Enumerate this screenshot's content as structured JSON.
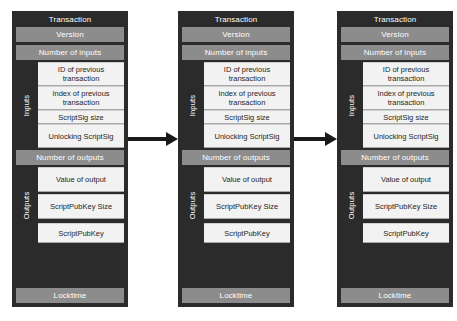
{
  "diagram": {
    "colors": {
      "block_background": "#2b2b2b",
      "bar_gray": "#8c8c8c",
      "field_light": "#f2f2f2",
      "arrow": "#1a1a1a",
      "page_background": "#ffffff",
      "text_light": "#ffffff",
      "text_dark": "#262626"
    },
    "arrows": [
      {
        "name": "arrow-block1-to-block2",
        "direction": "right"
      },
      {
        "name": "arrow-block2-to-block3",
        "direction": "right"
      }
    ],
    "blocks": [
      {
        "title": "Transaction",
        "version_label": "Version",
        "num_inputs_label": "Number of inputs",
        "inputs_side_label": "Inputs",
        "input_fields": [
          "ID of previous transaction",
          "Index of previous transaction",
          "ScriptSig size",
          "Unlocking ScriptSig"
        ],
        "num_outputs_label": "Number of outputs",
        "outputs_side_label": "Outputs",
        "output_fields": [
          "Value of output",
          "ScriptPubKey Size",
          "ScriptPubKey"
        ],
        "locktime_label": "Locktime"
      },
      {
        "title": "Transaction",
        "version_label": "Version",
        "num_inputs_label": "Number of inputs",
        "inputs_side_label": "Inputs",
        "input_fields": [
          "ID of previous transaction",
          "Index of previous transaction",
          "ScriptSig size",
          "Unlocking ScriptSig"
        ],
        "num_outputs_label": "Number of outputs",
        "outputs_side_label": "Outputs",
        "output_fields": [
          "Value of output",
          "ScriptPubKey Size",
          "ScriptPubKey"
        ],
        "locktime_label": "Locktime"
      },
      {
        "title": "Transaction",
        "version_label": "Version",
        "num_inputs_label": "Number of inputs",
        "inputs_side_label": "Inputs",
        "input_fields": [
          "ID of previous transaction",
          "Index of previous transaction",
          "ScriptSig size",
          "Unlocking ScriptSig"
        ],
        "num_outputs_label": "Number of outputs",
        "outputs_side_label": "Outputs",
        "output_fields": [
          "Value of output",
          "ScriptPubKey Size",
          "ScriptPubKey"
        ],
        "locktime_label": "Locktime"
      }
    ]
  }
}
